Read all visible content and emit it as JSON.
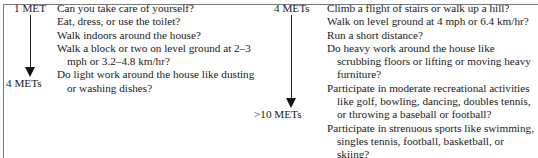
{
  "left_column": {
    "start_label": "1 MET",
    "end_label": "4 METs",
    "lines": [
      {
        "text": "Can you take care of yourself?",
        "indent": false
      },
      {
        "text": "Eat, dress, or use the toilet?",
        "indent": false
      },
      {
        "text": "Walk indoors around the house?",
        "indent": false
      },
      {
        "text": "Walk a block or two on level ground at 2–3",
        "indent": false
      },
      {
        "text": "mph or 3.2–4.8 km/hr?",
        "indent": true
      },
      {
        "text": "Do light work around the house like dusting",
        "indent": false
      },
      {
        "text": "or washing dishes?",
        "indent": true
      }
    ]
  },
  "right_column": {
    "start_label": "4 METs",
    "end_label": ">10 METs",
    "lines": [
      {
        "text": "Climb a flight of stairs or walk up a hill?",
        "indent": false
      },
      {
        "text": "Walk on level ground at 4 mph or 6.4 km/hr?",
        "indent": false
      },
      {
        "text": "Run a short distance?",
        "indent": false
      },
      {
        "text": "Do heavy work around the house like",
        "indent": false
      },
      {
        "text": "scrubbing floors or lifting or moving heavy",
        "indent": true
      },
      {
        "text": "furniture?",
        "indent": true
      },
      {
        "text": "Participate in moderate recreational activities",
        "indent": false
      },
      {
        "text": "like golf, bowling, dancing, doubles tennis,",
        "indent": true
      },
      {
        "text": "or throwing a baseball or football?",
        "indent": true
      },
      {
        "text": "Participate in strenuous sports like swimming,",
        "indent": false
      },
      {
        "text": "singles tennis, football, basketball, or",
        "indent": true
      },
      {
        "text": "skiing?",
        "indent": true
      }
    ]
  },
  "icons": {
    "left_arrow": "down-arrow-icon",
    "right_arrow": "down-arrow-icon"
  }
}
